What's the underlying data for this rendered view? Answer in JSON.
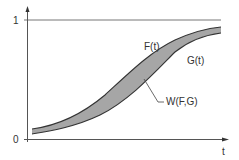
{
  "diagram": {
    "axes": {
      "y_tick_top": "1",
      "y_tick_bottom": "0",
      "x_label": "t"
    },
    "curves": {
      "upper_label": "F(t)",
      "lower_label": "G(t)",
      "area_label": "W(F,G)"
    },
    "colors": {
      "fill": "#a6a6a6",
      "line": "#333333",
      "axis": "#555555",
      "reference_line": "#777777"
    }
  }
}
